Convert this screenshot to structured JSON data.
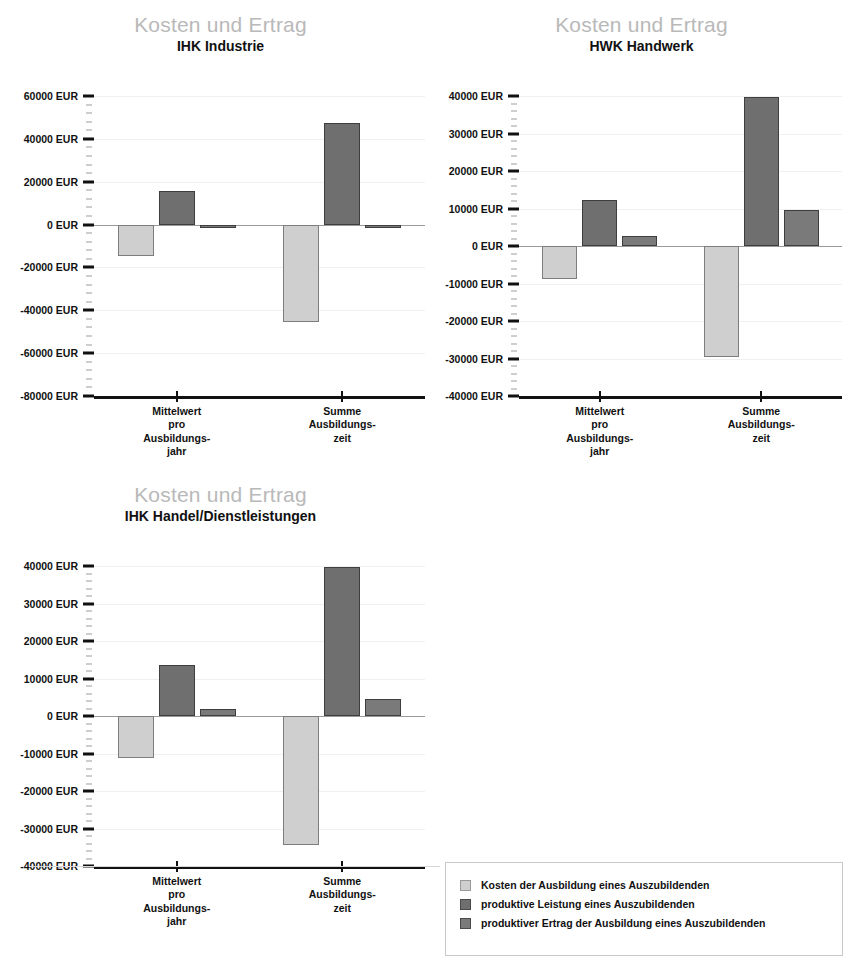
{
  "page": {
    "top_artifact_text": "",
    "shared_title": "Kosten und Ertrag"
  },
  "legend": {
    "name": "chart-legend",
    "entries": [
      {
        "label": "Kosten der Ausbildung eines Auszubildenden",
        "color": "#cfcfcf",
        "series_key": "kosten"
      },
      {
        "label": "produktive Leistung eines Auszubildenden",
        "color": "#6f6f6f",
        "series_key": "produktive_leistung"
      },
      {
        "label": "produktiver Ertrag der Ausbildung eines Auszubildenden",
        "color": "#7a7a7a",
        "series_key": "produktiver_ertrag"
      }
    ]
  },
  "chart_data": [
    {
      "id": "ihk-industrie",
      "type": "bar",
      "title": "Kosten und Ertrag",
      "subtitle": "IHK Industrie",
      "xlabel": "",
      "ylabel": "",
      "unit": "EUR",
      "categories": [
        "Mittelwert\npro\nAusbildungs-\njahr",
        "Summe\nAusbildungs-\nzeit"
      ],
      "ylim": [
        -80000,
        60000
      ],
      "ytick_step": 20000,
      "yticks": [
        60000,
        40000,
        20000,
        0,
        -20000,
        -40000,
        -60000,
        -80000
      ],
      "ytick_labels": [
        "60000 EUR",
        "40000 EUR",
        "20000 EUR",
        "0 EUR",
        "-20000 EUR",
        "-40000 EUR",
        "-60000 EUR",
        "-80000 EUR"
      ],
      "minor_ticks_per_interval": 4,
      "grid": true,
      "legend_position": "external-bottom-right",
      "series": [
        {
          "name": "Kosten der Ausbildung eines Auszubildenden",
          "color": "#cfcfcf",
          "values": [
            -14500,
            -45500
          ]
        },
        {
          "name": "produktive Leistung eines Auszubildenden",
          "color": "#6f6f6f",
          "values": [
            15500,
            47500
          ]
        },
        {
          "name": "produktiver Ertrag der Ausbildung eines Auszubildenden",
          "color": "#7a7a7a",
          "values": [
            -400,
            -1200
          ]
        }
      ]
    },
    {
      "id": "hwk-handwerk",
      "type": "bar",
      "title": "Kosten und Ertrag",
      "subtitle": "HWK Handwerk",
      "xlabel": "",
      "ylabel": "",
      "unit": "EUR",
      "categories": [
        "Mittelwert\npro\nAusbildungs-\njahr",
        "Summe\nAusbildungs-\nzeit"
      ],
      "ylim": [
        -40000,
        40000
      ],
      "ytick_step": 10000,
      "yticks": [
        40000,
        30000,
        20000,
        10000,
        0,
        -10000,
        -20000,
        -30000,
        -40000
      ],
      "ytick_labels": [
        "40000 EUR",
        "30000 EUR",
        "20000 EUR",
        "10000 EUR",
        "0 EUR",
        "-10000 EUR",
        "-20000 EUR",
        "-30000 EUR",
        "-40000 EUR"
      ],
      "minor_ticks_per_interval": 4,
      "grid": true,
      "legend_position": "external-bottom-right",
      "series": [
        {
          "name": "Kosten der Ausbildung eines Auszubildenden",
          "color": "#cfcfcf",
          "values": [
            -8800,
            -29500
          ]
        },
        {
          "name": "produktive Leistung eines Auszubildenden",
          "color": "#6f6f6f",
          "values": [
            12200,
            39800
          ]
        },
        {
          "name": "produktiver Ertrag der Ausbildung eines Auszubildenden",
          "color": "#7a7a7a",
          "values": [
            2800,
            9500
          ]
        }
      ]
    },
    {
      "id": "ihk-handel-dienstleistungen",
      "type": "bar",
      "title": "Kosten und Ertrag",
      "subtitle": "IHK Handel/Dienstleistungen",
      "xlabel": "",
      "ylabel": "",
      "unit": "EUR",
      "categories": [
        "Mittelwert\npro\nAusbildungs-\njahr",
        "Summe\nAusbildungs-\nzeit"
      ],
      "ylim": [
        -40000,
        40000
      ],
      "ytick_step": 10000,
      "yticks": [
        40000,
        30000,
        20000,
        10000,
        0,
        -10000,
        -20000,
        -30000,
        -40000
      ],
      "ytick_labels": [
        "40000 EUR",
        "30000 EUR",
        "20000 EUR",
        "10000 EUR",
        "0 EUR",
        "-10000 EUR",
        "-20000 EUR",
        "-30000 EUR",
        "-40000 EUR"
      ],
      "minor_ticks_per_interval": 4,
      "grid": true,
      "legend_position": "external-bottom-right",
      "series": [
        {
          "name": "Kosten der Ausbildung eines Auszubildenden",
          "color": "#cfcfcf",
          "values": [
            -11300,
            -34300
          ]
        },
        {
          "name": "produktive Leistung eines Auszubildenden",
          "color": "#6f6f6f",
          "values": [
            13500,
            39800
          ]
        },
        {
          "name": "produktiver Ertrag der Ausbildung eines Auszubildenden",
          "color": "#7a7a7a",
          "values": [
            1800,
            4500
          ]
        }
      ]
    }
  ]
}
